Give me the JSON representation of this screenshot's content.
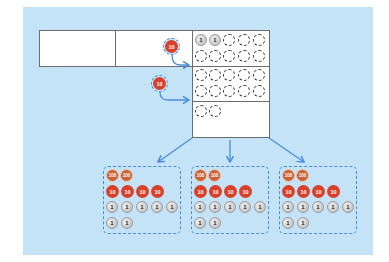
{
  "diagram": {
    "colors": {
      "background": "#c4e3f7",
      "arrow": "#4a8fd8",
      "ten_counter": "#d8402a",
      "hundred_counter": "#c8633a",
      "one_counter": "#c9c9c9"
    },
    "top_row": {
      "cells": [
        "",
        ""
      ],
      "moving_counter": "10"
    },
    "exchange_counter": "10",
    "ones_column": {
      "filled_ones": [
        "1",
        "1"
      ],
      "empty_slot_rows": [
        {
          "row": 1,
          "slots": 3
        },
        {
          "row": 2,
          "slots": 5
        },
        {
          "row": 3,
          "slots": 5
        },
        {
          "row": 4,
          "slots": 5
        },
        {
          "row": 5,
          "slots": 2
        }
      ]
    },
    "groups": [
      {
        "hundreds": [
          "100",
          "100"
        ],
        "tens": [
          "10",
          "10",
          "10",
          "10"
        ],
        "ones_row1": [
          "1",
          "1",
          "1",
          "1",
          "1"
        ],
        "ones_row2": [
          "1",
          "1"
        ]
      },
      {
        "hundreds": [
          "100",
          "100"
        ],
        "tens": [
          "10",
          "10",
          "10",
          "10"
        ],
        "ones_row1": [
          "1",
          "1",
          "1",
          "1",
          "1"
        ],
        "ones_row2": [
          "1",
          "1"
        ]
      },
      {
        "hundreds": [
          "100",
          "100"
        ],
        "tens": [
          "10",
          "10",
          "10",
          "10"
        ],
        "ones_row1": [
          "1",
          "1",
          "1",
          "1",
          "1"
        ],
        "ones_row2": [
          "1",
          "1"
        ]
      }
    ]
  }
}
